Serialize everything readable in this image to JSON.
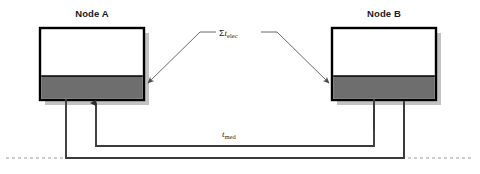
{
  "figure": {
    "type": "diagram",
    "background_color": "#ffffff"
  },
  "nodes": [
    {
      "id": "node-a",
      "title": "Node A",
      "box": {
        "x": 40,
        "y": 28,
        "width": 104,
        "height": 72
      },
      "top_section_color": "#ffffff",
      "bottom_section_color": "#6e6e6e",
      "bottom_section_height": 24,
      "border_color": "#000000",
      "shadow_color": "#b4b4b4"
    },
    {
      "id": "node-b",
      "title": "Node B",
      "box": {
        "x": 332,
        "y": 28,
        "width": 104,
        "height": 72
      },
      "top_section_color": "#ffffff",
      "bottom_section_color": "#6e6e6e",
      "bottom_section_height": 24,
      "border_color": "#000000",
      "shadow_color": "#b4b4b4"
    }
  ],
  "labels": {
    "elec": {
      "sigma": "Σ",
      "variable": "t",
      "subscript": "elec",
      "full_text": "Σt_elec"
    },
    "med": {
      "variable": "t",
      "subscript": "med",
      "full_text": "t_med"
    }
  },
  "leader_lines": {
    "elec_left": {
      "from": [
        215,
        32
      ],
      "to": [
        146,
        82
      ],
      "arrow_at": "to"
    },
    "elec_right": {
      "from": [
        262,
        32
      ],
      "to": [
        330,
        82
      ],
      "arrow_at": "to"
    }
  },
  "connectors": [
    {
      "id": "a-out",
      "from_node": "node-a",
      "arrow": false,
      "x": 66
    },
    {
      "id": "a-in",
      "from_node": "node-a",
      "arrow": true,
      "x": 96
    },
    {
      "id": "b-in",
      "from_node": "node-b",
      "arrow": true,
      "x": 374
    },
    {
      "id": "b-out",
      "from_node": "node-b",
      "arrow": false,
      "x": 404
    }
  ],
  "baseline": {
    "style": "dashed",
    "color": "#9a9a9a",
    "y": 158,
    "dash_pattern": "3,3"
  },
  "line_color": "#3a3a3a",
  "colors": {
    "gray_band": "#6e6e6e",
    "border": "#000000",
    "leader": "#555555",
    "dashed": "#9a9a9a"
  }
}
